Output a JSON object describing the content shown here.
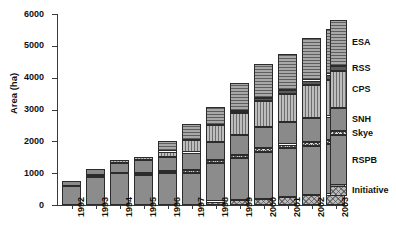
{
  "chart_data": {
    "type": "bar",
    "stacked": true,
    "title": "",
    "xlabel": "",
    "ylabel": "Area (ha)",
    "ylim": [
      0,
      6000
    ],
    "ytick_values": [
      0,
      1000,
      2000,
      3000,
      4000,
      5000,
      6000
    ],
    "ytick_labels": [
      "0",
      "1000",
      "2000",
      "3000",
      "4000",
      "5000",
      "6000"
    ],
    "grid": false,
    "legend_position": "right",
    "categories": [
      "1992",
      "1993",
      "1994",
      "1995",
      "1996",
      "1997",
      "1998",
      "1999",
      "2000",
      "2001",
      "2002",
      "2003"
    ],
    "series": [
      {
        "name": "Initiative",
        "values": [
          0,
          0,
          0,
          0,
          0,
          0,
          110,
          150,
          180,
          260,
          300,
          330
        ]
      },
      {
        "name": "RSPB",
        "values": [
          590,
          880,
          1000,
          950,
          1000,
          1020,
          1200,
          1320,
          1500,
          1520,
          1560,
          1580
        ]
      },
      {
        "name": "Skye",
        "values": [
          0,
          60,
          0,
          50,
          60,
          80,
          90,
          100,
          110,
          120,
          130,
          130
        ]
      },
      {
        "name": "SNH",
        "values": [
          170,
          200,
          330,
          420,
          460,
          550,
          590,
          620,
          660,
          700,
          730,
          740
        ]
      },
      {
        "name": "CPS",
        "values": [
          0,
          0,
          80,
          80,
          160,
          380,
          520,
          700,
          820,
          900,
          1050,
          1160
        ]
      },
      {
        "name": "RSS",
        "values": [
          0,
          0,
          0,
          0,
          0,
          0,
          0,
          60,
          80,
          110,
          140,
          160
        ]
      },
      {
        "name": "ESA",
        "values": [
          0,
          0,
          0,
          0,
          320,
          520,
          570,
          870,
          1080,
          1150,
          1330,
          1440
        ]
      }
    ],
    "totals": [
      760,
      1140,
      1410,
      1500,
      2000,
      2550,
      3080,
      3820,
      4430,
      4760,
      5240,
      5540
    ]
  },
  "legend": {
    "entries": [
      {
        "label": "ESA"
      },
      {
        "label": "RSS"
      },
      {
        "label": "CPS"
      },
      {
        "label": "SNH"
      },
      {
        "label": "Skye"
      },
      {
        "label": "RSPB"
      },
      {
        "label": "Initiative"
      }
    ]
  }
}
